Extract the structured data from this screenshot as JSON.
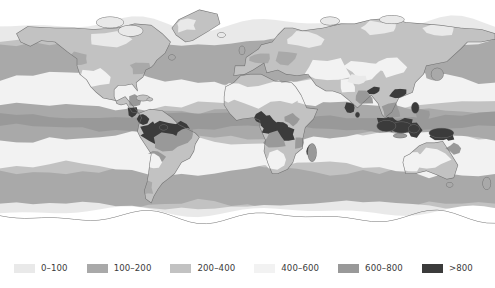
{
  "figure": {
    "kind": "choropleth-world-map",
    "projection": "equirectangular",
    "background_color": "#ffffff",
    "coastline_color": "#6e6e6e",
    "unclassified_color": "#ffffff"
  },
  "legend": {
    "orientation": "horizontal",
    "position": "bottom",
    "items": [
      {
        "label": "0–100",
        "color": "#e9e9e9",
        "min": 0,
        "max": 100
      },
      {
        "label": "100–200",
        "color": "#a9a9a9",
        "min": 100,
        "max": 200
      },
      {
        "label": "200–400",
        "color": "#c2c2c2",
        "min": 200,
        "max": 400
      },
      {
        "label": "400–600",
        "color": "#f2f2f2",
        "min": 400,
        "max": 600
      },
      {
        "label": "600–800",
        "color": "#999999",
        "min": 600,
        "max": 800
      },
      {
        "label": ">800",
        "color": "#3b3b3b",
        "min": 800,
        "max": null
      }
    ]
  },
  "chart_data": {
    "type": "heatmap",
    "title": "",
    "xlabel": "",
    "ylabel": "",
    "categories": [
      "0–100",
      "100–200",
      "200–400",
      "400–600",
      "600–800",
      ">800"
    ],
    "values": [
      1,
      2,
      3,
      4,
      5,
      6
    ],
    "colorscale": [
      "#e9e9e9",
      "#a9a9a9",
      "#c2c2c2",
      "#f2f2f2",
      "#999999",
      "#3b3b3b"
    ],
    "grid": false,
    "legend_position": "bottom",
    "xlim": [
      -180,
      180
    ],
    "ylim": [
      -90,
      90
    ],
    "regions": [
      {
        "name": "amazon-basin",
        "class": ">800"
      },
      {
        "name": "congo-basin",
        "class": ">800"
      },
      {
        "name": "maritime-southeast-asia",
        "class": ">800"
      },
      {
        "name": "new-guinea",
        "class": ">800"
      },
      {
        "name": "western-ghats-india",
        "class": ">800"
      },
      {
        "name": "south-china",
        "class": ">800"
      },
      {
        "name": "central-america",
        "class": ">800"
      },
      {
        "name": "sahara-desert",
        "class": "400–600"
      },
      {
        "name": "arabian-peninsula",
        "class": "400–600"
      },
      {
        "name": "central-australia",
        "class": "400–600"
      },
      {
        "name": "central-asia",
        "class": "400–600"
      },
      {
        "name": "antarctica",
        "class": "unclassified"
      }
    ]
  }
}
